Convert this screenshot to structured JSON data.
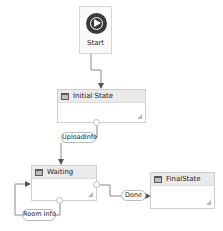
{
  "diagram": {
    "type": "state-machine-workflow",
    "start": {
      "label": "Start",
      "icon": "play-circle-icon"
    },
    "states": [
      {
        "id": "initial",
        "title": "Initial State",
        "icon": "state-icon"
      },
      {
        "id": "waiting",
        "title": "Waiting",
        "icon": "state-icon"
      },
      {
        "id": "final",
        "title": "FinalState",
        "icon": "final-state-icon"
      }
    ],
    "transitions": [
      {
        "from": "start",
        "to": "initial",
        "label": ""
      },
      {
        "from": "initial",
        "to": "waiting",
        "label": "UploadInfo"
      },
      {
        "from": "waiting",
        "to": "waiting",
        "label": "Room Info"
      },
      {
        "from": "waiting",
        "to": "final",
        "label": "Done"
      }
    ]
  },
  "colors": {
    "wire": "#8a8a8a",
    "state_header": "#eaeaea",
    "state_border": "#cfcfcf",
    "start_icon": "#3a3a3a"
  }
}
